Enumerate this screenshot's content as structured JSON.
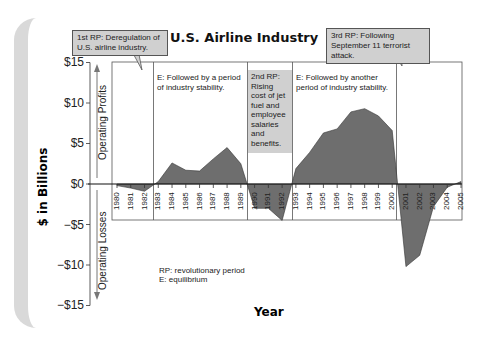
{
  "chart_data": {
    "type": "area",
    "title": "U.S. Airline Industry",
    "xlabel": "Year",
    "ylabel": "$ in Billions",
    "ylim": [
      -15,
      15
    ],
    "yticks": [
      "$15",
      "$10",
      "$5",
      "$0",
      "−$5",
      "−$10",
      "−$15"
    ],
    "ytick_values": [
      15,
      10,
      5,
      0,
      -5,
      -10,
      -15
    ],
    "axis_annotations": {
      "positive": "Operating Profits",
      "negative": "Operating Losses"
    },
    "categories": [
      "1980",
      "1981",
      "1982",
      "1983",
      "1984",
      "1985",
      "1986",
      "1987",
      "1988",
      "1989",
      "1990",
      "1991",
      "1992",
      "1993",
      "1994",
      "1995",
      "1996",
      "1997",
      "1998",
      "1999",
      "2000",
      "2001",
      "2002",
      "2003",
      "2004",
      "2005"
    ],
    "series": [
      {
        "name": "Operating profit/loss ($B)",
        "values": [
          -0.2,
          -0.5,
          -0.9,
          0.3,
          2.6,
          1.7,
          1.6,
          3.1,
          4.5,
          2.5,
          -3.0,
          -3.0,
          -4.5,
          1.9,
          3.9,
          6.3,
          6.8,
          8.9,
          9.3,
          8.4,
          6.6,
          -10.2,
          -8.8,
          -2.8,
          -0.4,
          0.3
        ]
      }
    ],
    "regions": [
      {
        "label": "1st RP: Deregulation of U.S. airline industry.",
        "type": "RP",
        "from": "1980",
        "to": "1982"
      },
      {
        "label": "E: Followed by a period of industry stability.",
        "type": "E",
        "from": "1983",
        "to": "1989"
      },
      {
        "label": "2nd RP: Rising cost of jet fuel and employee salaries and benefits.",
        "type": "RP",
        "from": "1990",
        "to": "1992"
      },
      {
        "label": "E: Followed by another period of industry stability.",
        "type": "E",
        "from": "1993",
        "to": "2000"
      },
      {
        "label": "3rd RP: Following September 11 terrorist attack.",
        "type": "RP",
        "from": "2001",
        "to": "2005"
      }
    ],
    "legend": [
      "RP: revolutionary period",
      "E: equilibrium"
    ],
    "grid": false
  },
  "callouts": {
    "rp1": "1st RP: Deregulation of U.S. airline industry.",
    "rp2": "2nd RP: Rising cost of jet fuel and employee salaries and benefits.",
    "rp3": "3rd RP: Following September 11 terrorist attack.",
    "e1": "E: Followed by a period of industry stability.",
    "e2": "E: Followed by another period of industry stability."
  },
  "legend": {
    "line1": "RP: revolutionary period",
    "line2": "E: equilibrium"
  },
  "colors": {
    "fill": "#6e6e6e",
    "callout": "#d0d0d0",
    "frame": "#d9d9d9"
  }
}
